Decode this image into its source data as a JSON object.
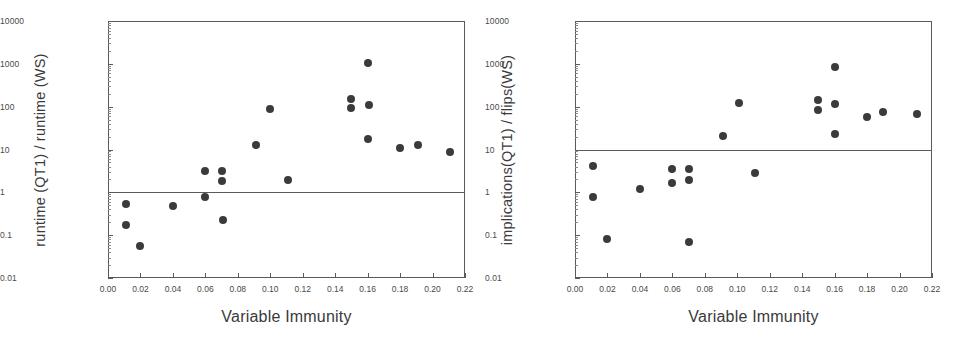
{
  "figure": {
    "panels": [
      "left",
      "right"
    ]
  },
  "chart_data": [
    {
      "type": "scatter",
      "panel": "left",
      "title": "",
      "xlabel": "Variable Immunity",
      "ylabel": "runtime (QT1) / runtime (WS)",
      "xlim": [
        0.0,
        0.22
      ],
      "ylim": [
        0.01,
        10000
      ],
      "yscale": "log",
      "xscale": "linear",
      "grid": false,
      "legend": null,
      "xticks": [
        0.0,
        0.02,
        0.04,
        0.06,
        0.08,
        0.1,
        0.12,
        0.14,
        0.16,
        0.18,
        0.2,
        0.22
      ],
      "xticklabels": [
        "0.00",
        "0.02",
        "0.04",
        "0.06",
        "0.08",
        "0.10",
        "0.12",
        "0.14",
        "0.16",
        "0.18",
        "0.20",
        "0.22"
      ],
      "yticks": [
        0.01,
        0.1,
        1,
        10,
        100,
        1000,
        10000
      ],
      "yticklabels": [
        "0.01",
        "0.1",
        "1",
        "10",
        "100",
        "1000",
        "10000"
      ],
      "reference_line": {
        "y": 1,
        "orientation": "horizontal"
      },
      "marker": {
        "shape": "circle",
        "color": "#3b3b3b",
        "size": 8
      },
      "points": [
        {
          "x": 0.011,
          "y": 0.52
        },
        {
          "x": 0.011,
          "y": 0.175
        },
        {
          "x": 0.02,
          "y": 0.057
        },
        {
          "x": 0.04,
          "y": 0.48
        },
        {
          "x": 0.06,
          "y": 3.2
        },
        {
          "x": 0.06,
          "y": 0.78
        },
        {
          "x": 0.07,
          "y": 3.2
        },
        {
          "x": 0.07,
          "y": 1.85
        },
        {
          "x": 0.071,
          "y": 0.22
        },
        {
          "x": 0.091,
          "y": 12.5
        },
        {
          "x": 0.1,
          "y": 88
        },
        {
          "x": 0.111,
          "y": 1.9
        },
        {
          "x": 0.15,
          "y": 155
        },
        {
          "x": 0.15,
          "y": 95
        },
        {
          "x": 0.16,
          "y": 1050
        },
        {
          "x": 0.161,
          "y": 112
        },
        {
          "x": 0.16,
          "y": 18
        },
        {
          "x": 0.18,
          "y": 11
        },
        {
          "x": 0.191,
          "y": 13
        },
        {
          "x": 0.211,
          "y": 8.7
        }
      ]
    },
    {
      "type": "scatter",
      "panel": "right",
      "title": "",
      "xlabel": "Variable Immunity",
      "ylabel": "implications(QT1) / flips(WS)",
      "xlim": [
        0.0,
        0.22
      ],
      "ylim": [
        0.01,
        10000
      ],
      "yscale": "log",
      "xscale": "linear",
      "grid": false,
      "legend": null,
      "xticks": [
        0.0,
        0.02,
        0.04,
        0.06,
        0.08,
        0.1,
        0.12,
        0.14,
        0.16,
        0.18,
        0.2,
        0.22
      ],
      "xticklabels": [
        "0.00",
        "0.02",
        "0.04",
        "0.06",
        "0.08",
        "0.10",
        "0.12",
        "0.14",
        "0.16",
        "0.18",
        "0.20",
        "0.22"
      ],
      "yticks": [
        0.01,
        0.1,
        1,
        10,
        100,
        1000,
        10000
      ],
      "yticklabels": [
        "0.01",
        "0.1",
        "1",
        "10",
        "100",
        "1000",
        "10000"
      ],
      "reference_line": {
        "y": 10,
        "orientation": "horizontal"
      },
      "marker": {
        "shape": "circle",
        "color": "#3b3b3b",
        "size": 8
      },
      "points": [
        {
          "x": 0.011,
          "y": 4.1
        },
        {
          "x": 0.011,
          "y": 0.76
        },
        {
          "x": 0.02,
          "y": 0.083
        },
        {
          "x": 0.04,
          "y": 1.22
        },
        {
          "x": 0.06,
          "y": 3.5
        },
        {
          "x": 0.06,
          "y": 1.65
        },
        {
          "x": 0.07,
          "y": 3.5
        },
        {
          "x": 0.07,
          "y": 1.95
        },
        {
          "x": 0.07,
          "y": 0.071
        },
        {
          "x": 0.091,
          "y": 21
        },
        {
          "x": 0.101,
          "y": 125
        },
        {
          "x": 0.111,
          "y": 2.9
        },
        {
          "x": 0.15,
          "y": 140
        },
        {
          "x": 0.15,
          "y": 82
        },
        {
          "x": 0.16,
          "y": 840
        },
        {
          "x": 0.16,
          "y": 115
        },
        {
          "x": 0.16,
          "y": 23
        },
        {
          "x": 0.18,
          "y": 58
        },
        {
          "x": 0.19,
          "y": 76
        },
        {
          "x": 0.211,
          "y": 68
        }
      ]
    }
  ]
}
